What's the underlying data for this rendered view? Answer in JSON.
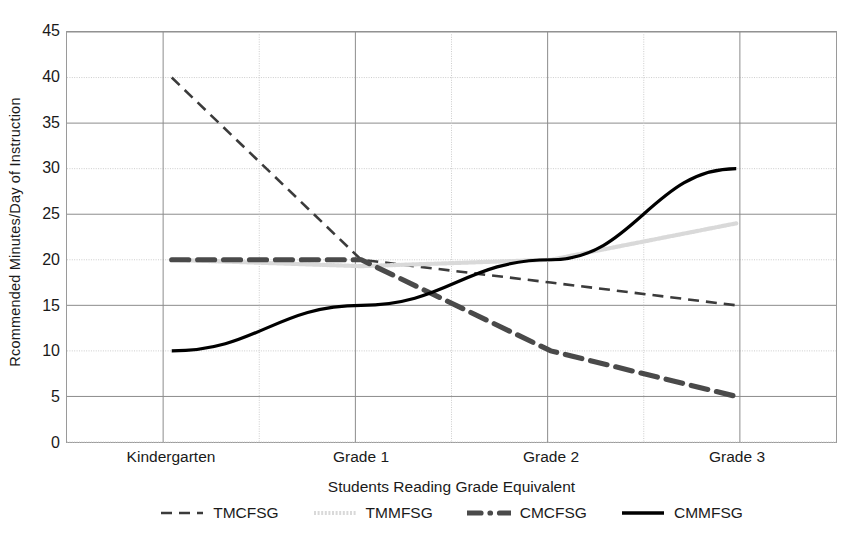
{
  "chart_data": {
    "type": "line",
    "title": "",
    "xlabel": "Students Reading Grade Equivalent",
    "ylabel": "Rcommended Minutes/Day of Instruction",
    "categories": [
      "Kindergarten",
      "Grade 1",
      "Grade 2",
      "Grade 3"
    ],
    "ylim": [
      0,
      45
    ],
    "ytick_step": 5,
    "yticks": [
      "45",
      "40",
      "35",
      "30",
      "25",
      "20",
      "15",
      "10",
      "5",
      "0"
    ],
    "grid": true,
    "legend_position": "bottom",
    "series": [
      {
        "name": "TMCFSG",
        "values": [
          40,
          20,
          17.5,
          15
        ],
        "style": "dashed",
        "color": "#3b3b3b",
        "width": 2.6,
        "dash": "11,7"
      },
      {
        "name": "TMMFSG",
        "values": [
          20,
          19.3,
          20,
          24
        ],
        "style": "dotted-light",
        "color": "#d9d9d9",
        "width": 4.2,
        "dash": "2,1.6"
      },
      {
        "name": "CMCFSG",
        "values": [
          20,
          20,
          10,
          5
        ],
        "style": "thick-dash-dot",
        "color": "#4a4a4a",
        "width": 5.2,
        "dash": "17,9"
      },
      {
        "name": "CMMFSG",
        "values": [
          10,
          15,
          20,
          30
        ],
        "style": "solid",
        "color": "#000000",
        "width": 3.2,
        "dash": "none"
      }
    ]
  },
  "legend": {
    "items": [
      {
        "label": "TMCFSG",
        "marker": "dashed-line-swatch"
      },
      {
        "label": "TMMFSG",
        "marker": "light-dotted-line-swatch"
      },
      {
        "label": "CMCFSG",
        "marker": "thick-dash-dot-line-swatch"
      },
      {
        "label": "CMMFSG",
        "marker": "solid-line-swatch"
      }
    ]
  },
  "colors": {
    "axis": "#9a9a9a",
    "gridline_major": "#8c8c8c",
    "gridline_minor": "#cccccc",
    "text": "#1a1a1a",
    "background": "#ffffff"
  }
}
